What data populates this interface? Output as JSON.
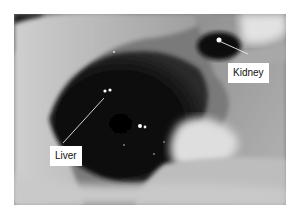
{
  "figure": {
    "labels": [
      {
        "text": "Kidney"
      },
      {
        "text": "Liver"
      }
    ]
  },
  "colors": {
    "background": "#ffffff",
    "organ_dark": "#0c0c0c",
    "fur_light": "#d8d8d8",
    "label_bg": "#ffffff",
    "pointer_line": "#e8e8e8"
  }
}
